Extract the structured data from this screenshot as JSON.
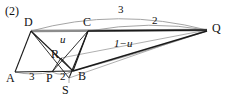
{
  "figure": {
    "number_label": "(2)",
    "colors": {
      "stroke_dark": "#1a1a1a",
      "stroke_thick_gray": "#8c8c8c",
      "stroke_thin_gray": "#9a9a9a",
      "background": "#ffffff",
      "text": "#111111"
    },
    "vertices": [
      {
        "name": "D",
        "label": "D",
        "x": 31,
        "y": 31,
        "label_x": 24,
        "label_y": 16
      },
      {
        "name": "C",
        "label": "C",
        "x": 88,
        "y": 31,
        "label_x": 83,
        "label_y": 16
      },
      {
        "name": "Q",
        "label": "Q",
        "x": 207,
        "y": 30,
        "label_x": 212,
        "label_y": 22
      },
      {
        "name": "A",
        "label": "A",
        "x": 15,
        "y": 72,
        "label_x": 8,
        "label_y": 72
      },
      {
        "name": "P",
        "label": "P",
        "x": 52,
        "y": 72,
        "label_x": 47,
        "label_y": 72
      },
      {
        "name": "B",
        "label": "B",
        "x": 73,
        "y": 71,
        "label_x": 78,
        "label_y": 70
      },
      {
        "name": "R",
        "label": "R",
        "x": 61,
        "y": 58,
        "label_x": 52,
        "label_y": 49
      },
      {
        "name": "S",
        "label": "S",
        "x": 69,
        "y": 78,
        "label_x": 63,
        "label_y": 84
      }
    ],
    "edge_labels": [
      {
        "name": "arc-dq-length",
        "text": "3",
        "x": 120,
        "y": 6
      },
      {
        "name": "arc-cq-length",
        "text": "2",
        "x": 154,
        "y": 16
      },
      {
        "name": "segment-u",
        "text": "u",
        "x": 61,
        "y": 35
      },
      {
        "name": "segment-one-minus-u",
        "text": "1−u",
        "x": 118,
        "y": 40
      },
      {
        "name": "segment-ap-length",
        "text": "3",
        "x": 31,
        "y": 71
      },
      {
        "name": "segment-pb-length",
        "text": "2",
        "x": 61,
        "y": 71
      }
    ]
  }
}
